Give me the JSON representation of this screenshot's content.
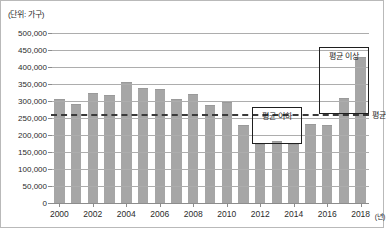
{
  "unit_caption": "(단위: 가구)",
  "x_axis_unit": "(년)",
  "average_label": "평균",
  "callouts": [
    {
      "id": "above-average",
      "text": "평균 이상"
    },
    {
      "id": "below-average",
      "text": "평균 이하"
    }
  ],
  "colors": {
    "bar": "#a6a6a6",
    "gridline": "#adadad",
    "axis": "#8c8c8c",
    "average_line": "#3a3a3a",
    "callout_border": "#1f1f1f",
    "text": "#2b2b2b",
    "background": "#ffffff"
  },
  "chart_data": {
    "type": "bar",
    "title": "",
    "subtitle": "",
    "xlabel": "(년)",
    "ylabel": "(단위: 가구)",
    "ylim": [
      0,
      500000
    ],
    "ytick_values": [
      0,
      50000,
      100000,
      150000,
      200000,
      250000,
      300000,
      350000,
      400000,
      450000,
      500000
    ],
    "ytick_labels": [
      "0",
      "50,000",
      "100,000",
      "150,000",
      "200,000",
      "250,000",
      "300,000",
      "350,000",
      "400,000",
      "450,000",
      "500,000"
    ],
    "grid": true,
    "legend": false,
    "xtick_labels": [
      "2000",
      "2002",
      "2004",
      "2006",
      "2008",
      "2010",
      "2012",
      "2014",
      "2016",
      "2018"
    ],
    "categories": [
      "2000",
      "2001",
      "2002",
      "2003",
      "2004",
      "2005",
      "2006",
      "2007",
      "2008",
      "2009",
      "2010",
      "2011",
      "2012",
      "2013",
      "2014",
      "2015",
      "2016",
      "2017",
      "2018"
    ],
    "values": [
      306000,
      291000,
      323000,
      318000,
      356000,
      338000,
      334000,
      306000,
      320000,
      288000,
      296000,
      229000,
      173000,
      182000,
      174000,
      231000,
      230000,
      310000,
      430000
    ],
    "annotations": [
      {
        "label": "평균",
        "type": "hline",
        "value": 262000,
        "style": "dashed"
      },
      {
        "label": "평균 이상",
        "type": "box",
        "x_range": [
          "2016",
          "2018"
        ],
        "y_range": [
          262000,
          430000
        ]
      },
      {
        "label": "평균 이하",
        "type": "box",
        "x_range": [
          "2012",
          "2014"
        ],
        "y_range": [
          174000,
          252000
        ]
      }
    ]
  }
}
